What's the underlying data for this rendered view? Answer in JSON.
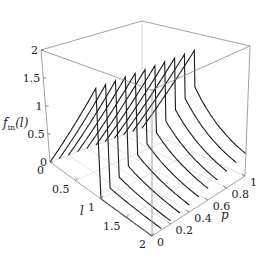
{
  "chart_data": {
    "type": "3d-line",
    "title": "",
    "zlabel": "f_in(l)",
    "zlabel_main": "f",
    "zlabel_sub": "in",
    "zlabel_arg": "(l)",
    "xlabel": "l",
    "ylabel": "p",
    "xlim": [
      0,
      2
    ],
    "ylim": [
      0,
      1
    ],
    "zlim": [
      0,
      2
    ],
    "x_ticks": [
      "0",
      "0.5",
      "1",
      "1.5",
      "2"
    ],
    "y_ticks": [
      "0",
      "0.2",
      "0.4",
      "0.6",
      "0.8",
      "1"
    ],
    "z_ticks": [
      "0",
      "0.5",
      "1",
      "1.5",
      "2"
    ],
    "series_p_values": [
      0,
      0.1,
      0.2,
      0.3,
      0.4,
      0.5,
      0.6,
      0.7,
      0.8,
      0.9,
      1.0
    ],
    "peak_value": 1.75,
    "peak_l": 1,
    "grid": true,
    "box": true
  },
  "colors": {
    "curve": "#1a1a1a",
    "box": "#8a8a8a",
    "grid": "#d8d8d8"
  }
}
